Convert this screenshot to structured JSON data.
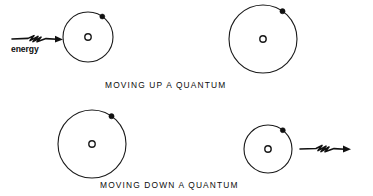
{
  "diagram": {
    "title_top": "MOVING UP A QUANTUM",
    "title_bottom": "MOVING DOWN A QUANTUM",
    "energy_label": "energy",
    "nucleus_glyph": "o",
    "ink_color": "#111111",
    "background_color": "#ffffff",
    "panels": [
      {
        "id": "top-left",
        "caption_group": "MOVING UP A QUANTUM",
        "state": "before",
        "orbit_radius": 25,
        "orbit_center": [
          88,
          37
        ],
        "electron_angle_deg": -55,
        "has_energy_arrow": true,
        "energy_arrow_direction": "inward"
      },
      {
        "id": "top-right",
        "caption_group": "MOVING UP A QUANTUM",
        "state": "after",
        "orbit_radius": 34,
        "orbit_center": [
          263,
          39
        ],
        "electron_angle_deg": -55,
        "has_energy_arrow": false,
        "energy_arrow_direction": "none"
      },
      {
        "id": "bottom-left",
        "caption_group": "MOVING DOWN A QUANTUM",
        "state": "before",
        "orbit_radius": 34,
        "orbit_center": [
          92,
          144
        ],
        "electron_angle_deg": -55,
        "has_energy_arrow": false,
        "energy_arrow_direction": "none"
      },
      {
        "id": "bottom-right",
        "caption_group": "MOVING DOWN A QUANTUM",
        "state": "after",
        "orbit_radius": 24,
        "orbit_center": [
          268,
          149
        ],
        "electron_angle_deg": -52,
        "has_energy_arrow": true,
        "energy_arrow_direction": "outward"
      }
    ]
  }
}
